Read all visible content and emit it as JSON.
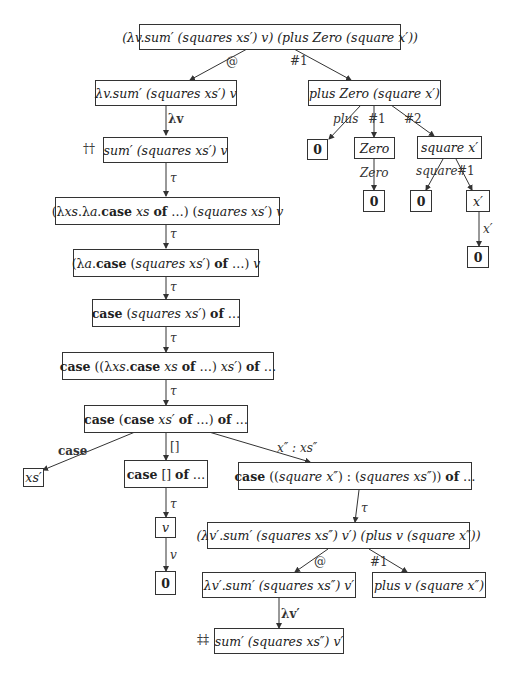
{
  "nodes": {
    "root": "(λv.sum′ (squares xs′) v) (plus Zero (square x′))",
    "app_left": "λv.sum′ (squares xs′) v",
    "app_right": "plus Zero (square x′)",
    "sum_v": "sum′ (squares xs′) v",
    "beta1": "(λxs.λa.case xs of …) (squares xs′) v",
    "beta2": "(λa.case (squares xs′) of …) v",
    "case1": "case (squares xs′) of …",
    "case2": "case ((λxs.case xs of …) xs′) of …",
    "case3": "case (case xs′ of …) of …",
    "xs_leaf": "xs′",
    "case_nil": "case [] of …",
    "case_cons": "case ((square x″) : (squares xs″)) of …",
    "v_node": "v",
    "zero_v": "0",
    "root2": "(λv′.sum′ (squares xs″) v′) (plus v (square x″))",
    "app2_left": "λv′.sum′ (squares xs″) v′",
    "app2_right": "plus v (square x″)",
    "sum_v2": "sum′ (squares xs″) v′",
    "plus_zero": "0",
    "zero_con": "Zero",
    "zero_con_child": "0",
    "square_x": "square x′",
    "square_zero": "0",
    "x_prime": "x′",
    "x_prime_zero": "0"
  },
  "edge_labels": {
    "at1": "@",
    "hash1_top": "#1",
    "lambda_v": "λv",
    "tau1": "τ",
    "tau2": "τ",
    "tau3": "τ",
    "tau4": "τ",
    "tau5": "τ",
    "plus": "plus",
    "hash1_plus": "#1",
    "hash2_plus": "#2",
    "zero": "Zero",
    "square": "square",
    "hash1_square": "#1",
    "x_prime": "x′",
    "case": "case",
    "nil": "[]",
    "cons": "x″ : xs″",
    "tau_nil": "τ",
    "v": "v",
    "tau_cons": "τ",
    "at2": "@",
    "hash1_2": "#1",
    "lambda_v2": "λv′"
  },
  "marks": {
    "dagger": "††",
    "double_dagger": "‡‡"
  }
}
